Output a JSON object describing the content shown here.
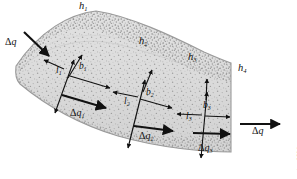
{
  "figure": {
    "credit": "© Cengage Learning 2014",
    "colors": {
      "band_fill": "#d9d9d9",
      "band_fill_light": "#e4e4e4",
      "band_edge": "#8c8c8c",
      "speckle": "#9a9a9a",
      "arrow": "#111111",
      "text": "#111111",
      "background": "#ffffff",
      "credit_text": "#4a4a4a"
    }
  },
  "thickness_labels": [
    {
      "name": "h1",
      "base": "h",
      "sub": "1"
    },
    {
      "name": "h2",
      "base": "h",
      "sub": "2"
    },
    {
      "name": "h3",
      "base": "h",
      "sub": "3"
    },
    {
      "name": "h4",
      "base": "h",
      "sub": "4"
    }
  ],
  "stations": [
    {
      "id": "station-1",
      "length": {
        "base": "l",
        "sub": "1"
      },
      "width": {
        "base": "b",
        "sub": "1"
      },
      "flux": {
        "delta": "Δ",
        "base": "q",
        "sub": "1"
      }
    },
    {
      "id": "station-2",
      "length": {
        "base": "l",
        "sub": "2"
      },
      "width": {
        "base": "b",
        "sub": "2"
      },
      "flux": {
        "delta": "Δ",
        "base": "q",
        "sub": "2"
      }
    },
    {
      "id": "station-3",
      "length": {
        "base": "l",
        "sub": "3"
      },
      "width": {
        "base": "b",
        "sub": "3"
      },
      "flux": {
        "delta": "Δ",
        "base": "q",
        "sub": "3"
      }
    }
  ],
  "flux_inlet": {
    "name": "delta-q-inlet",
    "delta": "Δ",
    "base": "q"
  },
  "flux_outlet": {
    "name": "delta-q-outlet",
    "delta": "Δ",
    "base": "q"
  }
}
